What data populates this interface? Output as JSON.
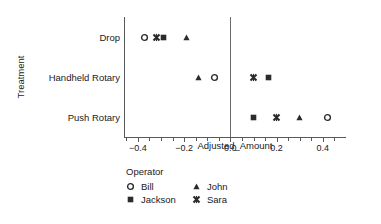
{
  "chart_data": {
    "type": "scatter",
    "title": "",
    "xlabel": "Adjusted_Amount",
    "ylabel": "Treatment",
    "xlim": [
      -0.46,
      0.5
    ],
    "xticks": [
      -0.4,
      -0.2,
      0.0,
      0.2,
      0.4
    ],
    "xticklabels": [
      "−0.4",
      "−0.2",
      "0.0",
      "0.2",
      "0.4"
    ],
    "x_minor_tick_step": 0.05,
    "categories": [
      "Drop",
      "Handheld Rotary",
      "Push Rotary"
    ],
    "grid": false,
    "reference_line_x": 0.0,
    "legend_title": "Operator",
    "legend_position": "below-left",
    "series": [
      {
        "name": "Bill",
        "marker": "circle-open",
        "points": [
          {
            "category": "Drop",
            "value": -0.37
          },
          {
            "category": "Handheld Rotary",
            "value": -0.07
          },
          {
            "category": "Push Rotary",
            "value": 0.42
          }
        ]
      },
      {
        "name": "Jackson",
        "marker": "square-filled",
        "points": [
          {
            "category": "Drop",
            "value": -0.29
          },
          {
            "category": "Handheld Rotary",
            "value": 0.165
          },
          {
            "category": "Push Rotary",
            "value": 0.1
          }
        ]
      },
      {
        "name": "John",
        "marker": "triangle-filled",
        "points": [
          {
            "category": "Drop",
            "value": -0.19
          },
          {
            "category": "Handheld Rotary",
            "value": -0.14
          },
          {
            "category": "Push Rotary",
            "value": 0.3
          }
        ]
      },
      {
        "name": "Sara",
        "marker": "x-bold",
        "points": [
          {
            "category": "Drop",
            "value": -0.32
          },
          {
            "category": "Handheld Rotary",
            "value": 0.1
          },
          {
            "category": "Push Rotary",
            "value": 0.2
          }
        ]
      }
    ],
    "colors": {
      "marker": "#2b2b2b",
      "axis": "#595959",
      "reference_line": "#6b6b6b",
      "text": "#1a1a1a",
      "background": "#ffffff"
    }
  },
  "legend": {
    "title": "Operator",
    "entries": [
      {
        "label": "Bill",
        "marker": "circle-open"
      },
      {
        "label": "John",
        "marker": "triangle-filled"
      },
      {
        "label": "Jackson",
        "marker": "square-filled"
      },
      {
        "label": "Sara",
        "marker": "x-bold"
      }
    ]
  },
  "axes": {
    "x_title": "Adjusted_Amount",
    "y_title": "Treatment"
  }
}
